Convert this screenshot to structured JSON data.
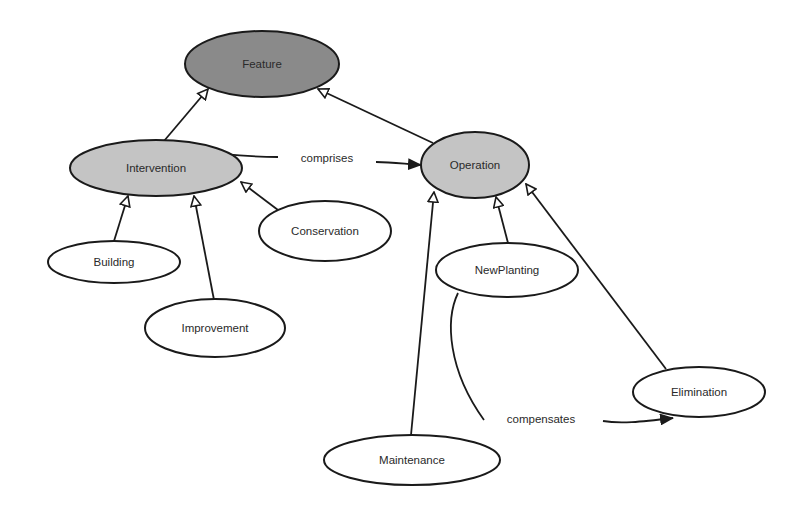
{
  "diagram": {
    "colors": {
      "background": "#ffffff",
      "stroke": "#1a1a1a",
      "root_fill": "#8a8a8a",
      "mid_fill": "#c4c4c4",
      "leaf_fill": "#ffffff"
    },
    "nodes": {
      "feature": {
        "label": "Feature",
        "cx": 262,
        "cy": 64,
        "rx": 77,
        "ry": 33,
        "level": "root"
      },
      "intervention": {
        "label": "Intervention",
        "cx": 156,
        "cy": 168,
        "rx": 86,
        "ry": 28,
        "level": "mid"
      },
      "operation": {
        "label": "Operation",
        "cx": 475,
        "cy": 165,
        "rx": 54,
        "ry": 33,
        "level": "mid"
      },
      "building": {
        "label": "Building",
        "cx": 114,
        "cy": 262,
        "rx": 66,
        "ry": 21,
        "level": "leaf"
      },
      "conservation": {
        "label": "Conservation",
        "cx": 325,
        "cy": 231,
        "rx": 66,
        "ry": 30,
        "level": "leaf"
      },
      "improvement": {
        "label": "Improvement",
        "cx": 215,
        "cy": 328,
        "rx": 70,
        "ry": 29,
        "level": "leaf"
      },
      "newplanting": {
        "label": "NewPlanting",
        "cx": 507,
        "cy": 270,
        "rx": 71,
        "ry": 27,
        "level": "leaf"
      },
      "elimination": {
        "label": "Elimination",
        "cx": 699,
        "cy": 392,
        "rx": 66,
        "ry": 25,
        "level": "leaf"
      },
      "maintenance": {
        "label": "Maintenance",
        "cx": 412,
        "cy": 460,
        "rx": 88,
        "ry": 25,
        "level": "leaf"
      }
    },
    "edges": {
      "comprises": {
        "label": "comprises",
        "from": "Intervention",
        "to": "Operation",
        "type": "association"
      },
      "compensates": {
        "label": "compensates",
        "from": "NewPlanting",
        "to": "Elimination",
        "type": "association"
      }
    },
    "inheritance": [
      {
        "from": "Intervention",
        "to": "Feature"
      },
      {
        "from": "Operation",
        "to": "Feature"
      },
      {
        "from": "Building",
        "to": "Intervention"
      },
      {
        "from": "Improvement",
        "to": "Intervention"
      },
      {
        "from": "Conservation",
        "to": "Intervention"
      },
      {
        "from": "Maintenance",
        "to": "Operation"
      },
      {
        "from": "NewPlanting",
        "to": "Operation"
      },
      {
        "from": "Elimination",
        "to": "Operation"
      }
    ]
  }
}
